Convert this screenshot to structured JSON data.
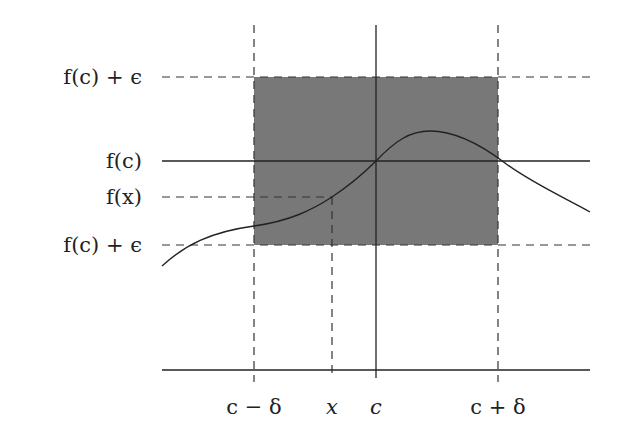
{
  "diagram": {
    "y_labels": {
      "upper": "f(c) + ϵ",
      "fc": "f(c)",
      "fx": "f(x)",
      "lower": "f(c) + ϵ"
    },
    "x_labels": {
      "c_minus_delta": "c − δ",
      "x": "x",
      "c": "c",
      "c_plus_delta": "c + δ"
    },
    "colors": {
      "shaded_region": "#787878",
      "lines": "#222222",
      "background": "#ffffff"
    },
    "geometry": {
      "x_c_minus_delta": 254,
      "x_x": 332,
      "x_c": 376,
      "x_c_plus_delta": 498,
      "y_upper": 77,
      "y_fc": 161,
      "y_fx": 197,
      "y_lower": 245,
      "y_axis": 370
    }
  }
}
